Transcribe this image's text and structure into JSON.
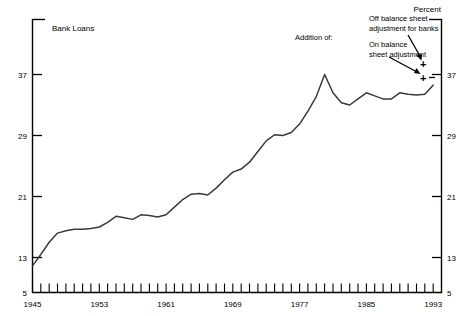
{
  "figure": {
    "series_title": "Bank Loans",
    "unit_label": "Percent"
  },
  "annotations": {
    "addition_of": "Addition of:",
    "off_balance_line1": "Off balance sheet",
    "off_balance_line2": "adjustment for banks",
    "on_balance_line1": "On balance",
    "on_balance_line2": "sheet adjustment",
    "marker_symbol": "+"
  },
  "chart_data": {
    "type": "line",
    "title": "Bank Loans",
    "xlabel": "",
    "ylabel": "Percent",
    "xlim": [
      1945,
      1994
    ],
    "ylim": [
      5,
      41
    ],
    "yticks": [
      5,
      13,
      21,
      29,
      37
    ],
    "ytick_labels": [
      "5",
      "13",
      "21",
      "29",
      "37"
    ],
    "xticks": [
      1945,
      1953,
      1961,
      1969,
      1977,
      1985,
      1993
    ],
    "xtick_labels": [
      "1945",
      "1953",
      "1961",
      "1969",
      "1977",
      "1985",
      "1993"
    ],
    "xtick_minor_step": 1,
    "grid": false,
    "legend": "none",
    "line_color": "#3a3a3a",
    "axis_color": "#000000",
    "x": [
      1945,
      1946,
      1947,
      1948,
      1949,
      1950,
      1951,
      1952,
      1953,
      1954,
      1955,
      1956,
      1957,
      1958,
      1959,
      1960,
      1961,
      1962,
      1963,
      1964,
      1965,
      1966,
      1967,
      1968,
      1969,
      1970,
      1971,
      1972,
      1973,
      1974,
      1975,
      1976,
      1977,
      1978,
      1979,
      1980,
      1981,
      1982,
      1983,
      1984,
      1985,
      1986,
      1987,
      1988,
      1989,
      1990,
      1991,
      1992,
      1993
    ],
    "values": [
      11.9,
      13.4,
      15.0,
      16.2,
      16.5,
      16.7,
      16.7,
      16.8,
      17.0,
      17.6,
      18.4,
      18.2,
      18.0,
      18.6,
      18.5,
      18.3,
      18.6,
      19.6,
      20.6,
      21.3,
      21.4,
      21.2,
      22.1,
      23.2,
      24.2,
      24.6,
      25.5,
      26.9,
      28.3,
      29.1,
      29.0,
      29.4,
      30.5,
      32.2,
      34.1,
      37.0,
      34.6,
      33.3,
      33.0,
      33.8,
      34.6,
      34.2,
      33.8,
      33.8,
      34.6,
      34.4,
      34.3,
      34.4,
      35.6
    ],
    "markers": [
      {
        "label": "On balance sheet adjustment",
        "value": 37.0,
        "year": 1993.6
      },
      {
        "label": "Off balance sheet adjustment for banks",
        "value": 38.7,
        "year": 1993.6
      }
    ],
    "series_note": "Values read from axis; peak 37 near 1974, secondary high near 1989, decline to 1993"
  }
}
